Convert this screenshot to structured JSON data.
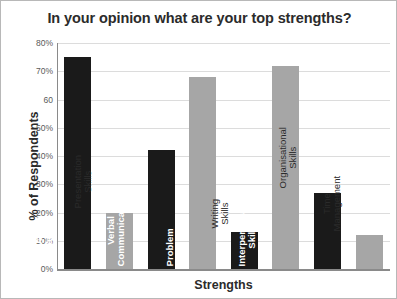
{
  "chart_data": {
    "type": "bar",
    "title": "In your opinion what are your top strengths?",
    "xlabel": "Strengths",
    "ylabel": "% of Respondents",
    "ylim": [
      0,
      80
    ],
    "grid": true,
    "legend": "none",
    "ytick_labels": [
      "80%",
      "70%",
      "60",
      "50%",
      "40%",
      "30%",
      "20%",
      "10%",
      "0%"
    ],
    "ytick_values": [
      80,
      70,
      60,
      50,
      40,
      30,
      20,
      10,
      0
    ],
    "categories": [
      "Innovative/ Creative",
      "Presentation Skills",
      "Verbal Communication",
      "Problem Solving",
      "Writing Skills",
      "Interpersonal Skills",
      "Organisational Skills",
      "Time Management"
    ],
    "values": [
      75,
      20,
      42,
      68,
      13,
      72,
      27,
      12
    ],
    "colors": [
      "#1a1a1a",
      "#a6a6a6",
      "#1a1a1a",
      "#a6a6a6",
      "#1a1a1a",
      "#a6a6a6",
      "#1a1a1a",
      "#a6a6a6"
    ]
  },
  "bars": [
    {
      "label_line1": "Innovative/",
      "label_line2": "Creative",
      "value": 75,
      "color": "#1a1a1a",
      "label_placement": "inside"
    },
    {
      "label_line1": "Presentation",
      "label_line2": "Skills",
      "value": 20,
      "color": "#a6a6a6",
      "label_placement": "outside"
    },
    {
      "label_line1": "Verbal",
      "label_line2": "Communication",
      "value": 42,
      "color": "#1a1a1a",
      "label_placement": "inside"
    },
    {
      "label_line1": "Problem",
      "label_line2": "Solving",
      "value": 68,
      "color": "#a6a6a6",
      "label_placement": "inside"
    },
    {
      "label_line1": "Writing",
      "label_line2": "Skills",
      "value": 13,
      "color": "#1a1a1a",
      "label_placement": "outside"
    },
    {
      "label_line1": "Interpersonal",
      "label_line2": "Skills",
      "value": 72,
      "color": "#a6a6a6",
      "label_placement": "inside"
    },
    {
      "label_line1": "Organisational",
      "label_line2": "Skills",
      "value": 27,
      "color": "#1a1a1a",
      "label_placement": "outside"
    },
    {
      "label_line1": "Time",
      "label_line2": "Management",
      "value": 12,
      "color": "#a6a6a6",
      "label_placement": "outside"
    }
  ]
}
